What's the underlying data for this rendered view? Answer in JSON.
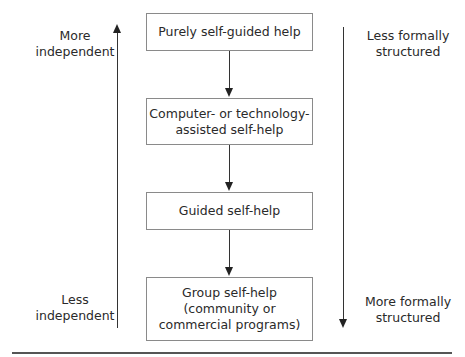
{
  "diagram": {
    "boxes": [
      {
        "label": "Purely self-guided help"
      },
      {
        "label": "Computer- or technology-\nassisted self-help"
      },
      {
        "label": "Guided self-help"
      },
      {
        "label": "Group self-help\n(community or\ncommercial programs)"
      }
    ],
    "left_axis": {
      "top_label": "More\nindependent",
      "bottom_label": "Less\nindependent",
      "direction": "up"
    },
    "right_axis": {
      "top_label": "Less formally\nstructured",
      "bottom_label": "More formally\nstructured",
      "direction": "down"
    }
  }
}
